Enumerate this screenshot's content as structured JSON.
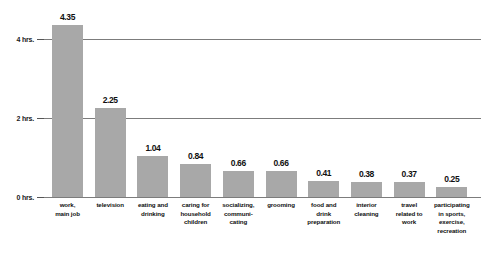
{
  "chart_data": {
    "type": "bar",
    "title": "",
    "subtitle": "",
    "xlabel": "",
    "ylabel": "",
    "ylim": [
      0,
      4.8
    ],
    "grid": true,
    "legend": "none",
    "y_ticks": [
      {
        "value": 0,
        "label": "0 hrs."
      },
      {
        "value": 2,
        "label": "2 hrs."
      },
      {
        "value": 4,
        "label": "4 hrs."
      }
    ],
    "categories": [
      "work, main job",
      "television",
      "eating and drinking",
      "caring for household children",
      "socializing, communicating",
      "grooming",
      "food and drink preparation",
      "interior cleaning",
      "travel related to work",
      "participating in sports, exercise, recreation"
    ],
    "category_lines": [
      [
        "work,",
        "main job"
      ],
      [
        "television"
      ],
      [
        "eating and",
        "drinking"
      ],
      [
        "caring for",
        "household",
        "children"
      ],
      [
        "socializing,",
        "communi-",
        "cating"
      ],
      [
        "grooming"
      ],
      [
        "food and",
        "drink",
        "preparation"
      ],
      [
        "interior",
        "cleaning"
      ],
      [
        "travel",
        "related to",
        "work"
      ],
      [
        "participating",
        "in sports,",
        "exercise,",
        "recreation"
      ]
    ],
    "values": [
      4.35,
      2.25,
      1.04,
      0.84,
      0.66,
      0.66,
      0.41,
      0.38,
      0.37,
      0.25
    ],
    "value_labels": [
      "4.35",
      "2.25",
      "1.04",
      "0.84",
      "0.66",
      "0.66",
      "0.41",
      "0.38",
      "0.37",
      "0.25"
    ],
    "colors": {
      "bar": "#a8a8a8",
      "gridline": "#7c7c7c",
      "axis_text": "#101010",
      "background": "#ffffff"
    }
  }
}
